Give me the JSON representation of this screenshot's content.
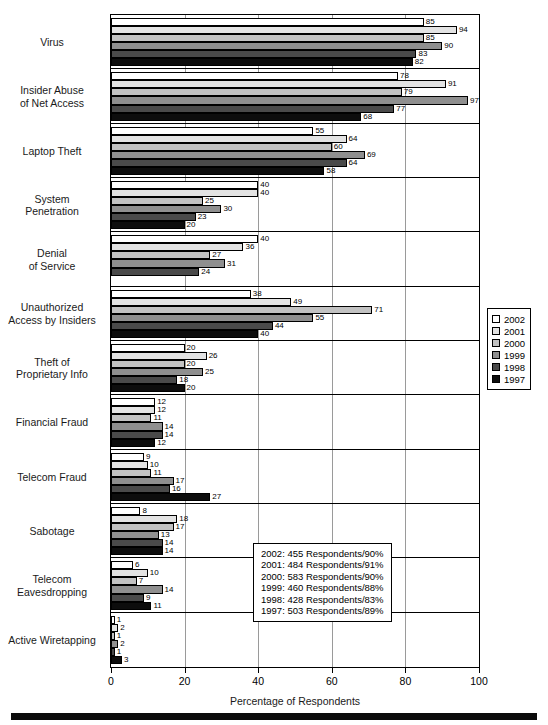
{
  "chart_data": {
    "type": "bar",
    "orientation": "horizontal",
    "title": "",
    "xlabel": "Percentage of Respondents",
    "ylabel": "",
    "xlim": [
      0,
      100
    ],
    "xticks": [
      0,
      20,
      40,
      60,
      80,
      100
    ],
    "grid": true,
    "legend_position": "right",
    "categories": [
      "Virus",
      "Insider Abuse\nof Net Access",
      "Laptop Theft",
      "System\nPenetration",
      "Denial\nof Service",
      "Unauthorized\nAccess by Insiders",
      "Theft of\nProprietary Info",
      "Financial Fraud",
      "Telecom Fraud",
      "Sabotage",
      "Telecom\nEavesdropping",
      "Active Wiretapping"
    ],
    "series": [
      {
        "name": "2002",
        "color": "#ffffff",
        "values": [
          85,
          78,
          55,
          40,
          40,
          38,
          20,
          12,
          9,
          8,
          6,
          1
        ]
      },
      {
        "name": "2001",
        "color": "#e3e3e3",
        "values": [
          94,
          91,
          64,
          40,
          36,
          49,
          26,
          12,
          10,
          18,
          10,
          2
        ]
      },
      {
        "name": "2000",
        "color": "#c2c2c2",
        "values": [
          85,
          79,
          60,
          25,
          27,
          71,
          20,
          11,
          11,
          17,
          7,
          1
        ]
      },
      {
        "name": "1999",
        "color": "#8f8f8f",
        "values": [
          90,
          97,
          69,
          30,
          31,
          55,
          25,
          14,
          17,
          13,
          14,
          2
        ]
      },
      {
        "name": "1998",
        "color": "#4a4a4a",
        "values": [
          83,
          77,
          64,
          23,
          24,
          44,
          18,
          14,
          16,
          14,
          9,
          1
        ]
      },
      {
        "name": "1997",
        "color": "#0d0d0d",
        "values": [
          82,
          68,
          58,
          20,
          null,
          40,
          20,
          12,
          27,
          14,
          11,
          3
        ]
      }
    ]
  },
  "category_labels": [
    {
      "lines": [
        "Virus"
      ]
    },
    {
      "lines": [
        "Insider Abuse",
        "of Net Access"
      ]
    },
    {
      "lines": [
        "Laptop Theft"
      ]
    },
    {
      "lines": [
        "System",
        "Penetration"
      ]
    },
    {
      "lines": [
        "Denial",
        "of Service"
      ]
    },
    {
      "lines": [
        "Unauthorized",
        "Access by Insiders"
      ]
    },
    {
      "lines": [
        "Theft of",
        "Proprietary Info"
      ]
    },
    {
      "lines": [
        "Financial Fraud"
      ]
    },
    {
      "lines": [
        "Telecom Fraud"
      ]
    },
    {
      "lines": [
        "Sabotage"
      ]
    },
    {
      "lines": [
        "Telecom",
        "Eavesdropping"
      ]
    },
    {
      "lines": [
        "Active Wiretapping"
      ]
    }
  ],
  "legend": {
    "entries": [
      {
        "label": "2002",
        "color": "#ffffff"
      },
      {
        "label": "2001",
        "color": "#e3e3e3"
      },
      {
        "label": "2000",
        "color": "#c2c2c2"
      },
      {
        "label": "1999",
        "color": "#8f8f8f"
      },
      {
        "label": "1998",
        "color": "#4a4a4a"
      },
      {
        "label": "1997",
        "color": "#0d0d0d"
      }
    ]
  },
  "respondents_box": {
    "lines": [
      "2002: 455 Respondents/90%",
      "2001: 484 Respondents/91%",
      "2000: 583 Respondents/90%",
      "1999: 460 Respondents/88%",
      "1998: 428 Respondents/83%",
      "1997: 503 Respondents/89%"
    ]
  },
  "axis": {
    "x_title": "Percentage of Respondents",
    "x_tick_labels": [
      "0",
      "20",
      "40",
      "60",
      "80",
      "100"
    ]
  }
}
